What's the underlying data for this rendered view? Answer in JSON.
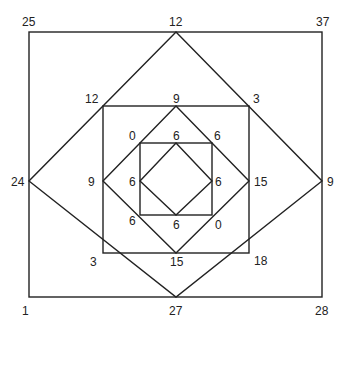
{
  "diagram": {
    "outer_square": {
      "top_left": "25",
      "top_right": "37",
      "bottom_left": "1",
      "bottom_right": "28"
    },
    "outer_diamond": {
      "top": "12",
      "left": "24",
      "right": "9",
      "bottom": "27"
    },
    "middle_square": {
      "top_left": "12",
      "top_right": "3",
      "bottom_left": "3",
      "bottom_right": "18"
    },
    "middle_diamond": {
      "top": "9",
      "left": "9",
      "right": "15",
      "bottom": "15"
    },
    "inner_square": {
      "top_left": "0",
      "top_right": "6",
      "bottom_left": "6",
      "bottom_right": "0"
    },
    "inner_diamond": {
      "top": "6",
      "left": "6",
      "right": "6",
      "bottom": "6"
    }
  }
}
